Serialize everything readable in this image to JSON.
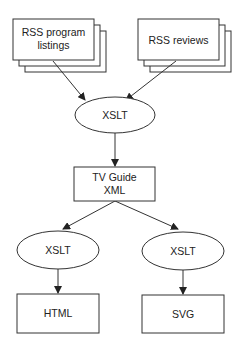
{
  "diagram": {
    "nodes": {
      "rss_listings": {
        "shape": "stacked-document",
        "lines": [
          "RSS program",
          "listings"
        ]
      },
      "rss_reviews": {
        "shape": "stacked-document",
        "lines": [
          "RSS reviews"
        ]
      },
      "xslt_top": {
        "shape": "ellipse",
        "lines": [
          "XSLT"
        ]
      },
      "tv_guide": {
        "shape": "rectangle",
        "lines": [
          "TV Guide",
          "XML"
        ]
      },
      "xslt_left": {
        "shape": "ellipse",
        "lines": [
          "XSLT"
        ]
      },
      "xslt_right": {
        "shape": "ellipse",
        "lines": [
          "XSLT"
        ]
      },
      "html": {
        "shape": "rectangle",
        "lines": [
          "HTML"
        ]
      },
      "svg": {
        "shape": "rectangle",
        "lines": [
          "SVG"
        ]
      }
    },
    "edges": [
      {
        "from": "rss_listings",
        "to": "xslt_top"
      },
      {
        "from": "rss_reviews",
        "to": "xslt_top"
      },
      {
        "from": "xslt_top",
        "to": "tv_guide"
      },
      {
        "from": "tv_guide",
        "to": "xslt_left"
      },
      {
        "from": "tv_guide",
        "to": "xslt_right"
      },
      {
        "from": "xslt_left",
        "to": "html"
      },
      {
        "from": "xslt_right",
        "to": "svg"
      }
    ],
    "colors": {
      "stroke": "#333333",
      "fill": "#ffffff",
      "text": "#222222"
    }
  }
}
